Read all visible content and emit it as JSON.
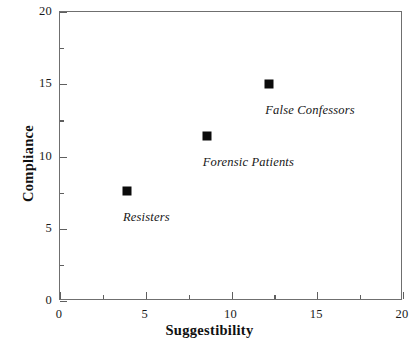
{
  "chart_data": {
    "type": "scatter",
    "title": "",
    "xlabel": "Suggestibility",
    "ylabel": "Compliance",
    "xlim": [
      0,
      20
    ],
    "ylim": [
      0,
      20
    ],
    "grid": false,
    "legend": "none",
    "x_ticks": [
      {
        "value": 0,
        "label": "0"
      },
      {
        "value": 5,
        "label": "5"
      },
      {
        "value": 10,
        "label": "10"
      },
      {
        "value": 15,
        "label": "15"
      },
      {
        "value": 20,
        "label": "20"
      }
    ],
    "x_minor_ticks": [
      2.5,
      7.5,
      12.5,
      17.5
    ],
    "y_ticks": [
      {
        "value": 0,
        "label": "0"
      },
      {
        "value": 5,
        "label": "5"
      },
      {
        "value": 10,
        "label": "10"
      },
      {
        "value": 15,
        "label": "15"
      },
      {
        "value": 20,
        "label": "20"
      }
    ],
    "y_minor_ticks": [
      2.5,
      7.5,
      12.5,
      17.5
    ],
    "points": [
      {
        "label": "Resisters",
        "x": 3.9,
        "y": 7.6,
        "label_dx": -4,
        "label_dy": 19
      },
      {
        "label": "Forensic Patients",
        "x": 8.55,
        "y": 11.4,
        "label_dx": -4,
        "label_dy": 19
      },
      {
        "label": "False Confessors",
        "x": 12.2,
        "y": 15.0,
        "label_dx": -4,
        "label_dy": 19
      }
    ],
    "marker_shape": "square",
    "marker_color": "#0b0b0b",
    "axis_color": "#6f6f6f",
    "text_color": "#111111"
  }
}
